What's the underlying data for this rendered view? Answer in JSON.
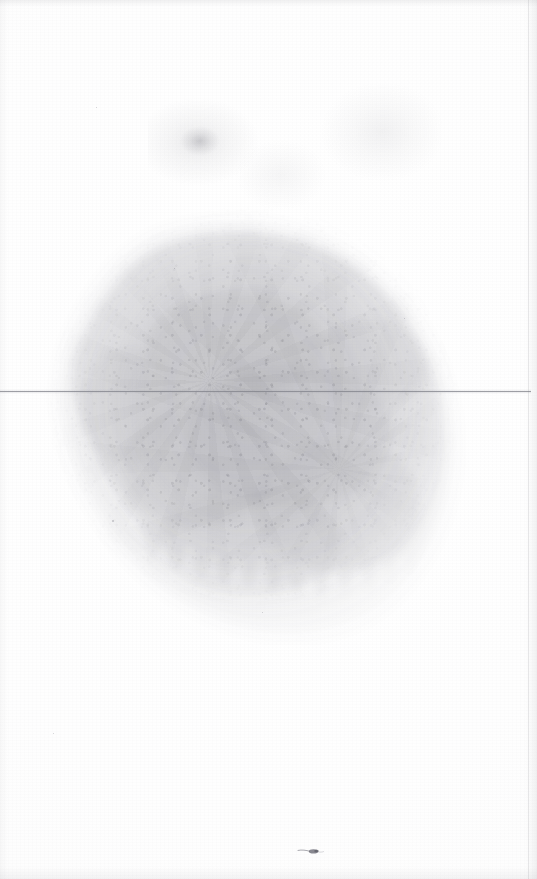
{
  "page": {
    "type": "scanned-document-page",
    "state": "faded",
    "width_px": 537,
    "height_px": 879,
    "background_color": "#fefefe",
    "visible_text": "",
    "ocr_legible_text": "none"
  },
  "colors": {
    "paper": "#fefefe",
    "rule": "#7e8088",
    "stain": "#8a8a92",
    "ink_speck": "#5c5c66",
    "scan_edge": "#787880"
  },
  "elements": {
    "horizontal_rule": {
      "name": "horizontal-rule",
      "y_px": 391,
      "x_start_px": 0,
      "x_end_px": 531,
      "thickness_px": 1,
      "color": "#7e8088"
    },
    "ink_stain": {
      "name": "faded-ink-stain",
      "left_px": 38,
      "top_px": 205,
      "width_px": 430,
      "height_px": 440,
      "description": "large grainy faded ink blob spanning the central page area"
    },
    "ghost_smudges": [
      {
        "name": "ghost-smudge-left",
        "left_px": 148,
        "top_px": 92,
        "width_px": 118,
        "height_px": 96
      },
      {
        "name": "ghost-smudge-right",
        "left_px": 318,
        "top_px": 84,
        "width_px": 124,
        "height_px": 104
      },
      {
        "name": "ghost-smudge-mid",
        "left_px": 236,
        "top_px": 140,
        "width_px": 90,
        "height_px": 70
      }
    ],
    "ink_speck": {
      "name": "ink-speck",
      "left_px": 296,
      "top_px": 845,
      "width_px": 30,
      "height_px": 12
    },
    "scan_edges": {
      "top": {
        "name": "scan-edge-top",
        "height_px": 7
      },
      "bottom": {
        "name": "scan-edge-bottom",
        "height_px": 12
      },
      "left": {
        "name": "scan-edge-left",
        "width_px": 8
      },
      "right": {
        "name": "scan-edge-right",
        "width_px": 12,
        "fold_line_x_px": 528
      }
    }
  },
  "dust_specks": [
    {
      "left_px": 112,
      "top_px": 520,
      "size_px": 2
    },
    {
      "left_px": 96,
      "top_px": 107,
      "size_px": 1
    },
    {
      "left_px": 53,
      "top_px": 733,
      "size_px": 1
    },
    {
      "left_px": 404,
      "top_px": 318,
      "size_px": 1
    },
    {
      "left_px": 262,
      "top_px": 612,
      "size_px": 1
    },
    {
      "left_px": 174,
      "top_px": 268,
      "size_px": 1
    }
  ]
}
